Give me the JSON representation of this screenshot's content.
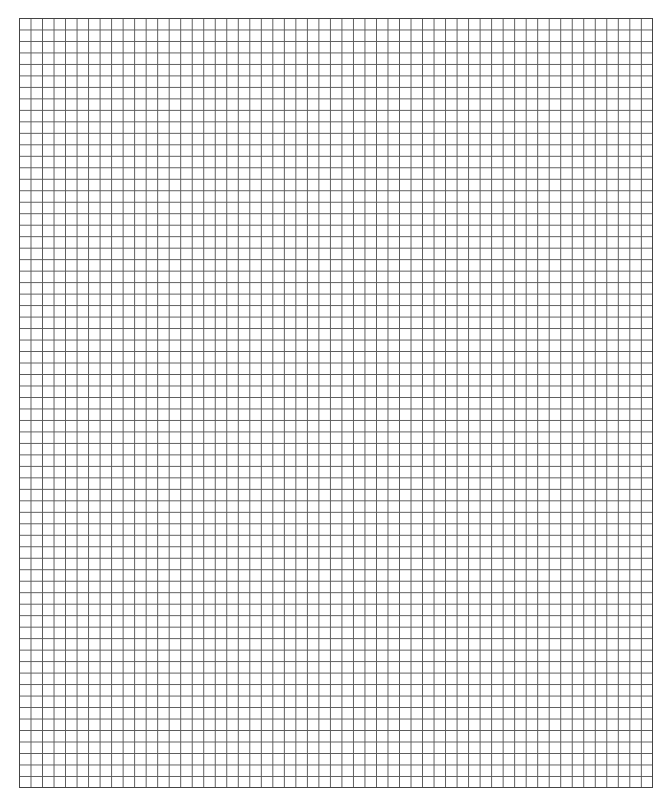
{
  "page": {
    "title_clipped": "",
    "grid": {
      "columns": 55,
      "rows": 67,
      "line_color": "#5a5a5a",
      "border_color": "#444444",
      "background": "#ffffff"
    }
  }
}
